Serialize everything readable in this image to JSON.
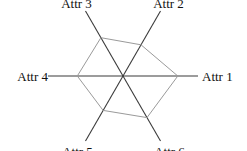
{
  "chart_data": {
    "type": "radar",
    "title": "",
    "categories": [
      "Attr 1",
      "Attr 2",
      "Attr 3",
      "Attr 4",
      "Attr 5",
      "Attr 6"
    ],
    "series": [
      {
        "name": "",
        "values": [
          0.73,
          0.48,
          0.59,
          0.61,
          0.53,
          0.64
        ]
      }
    ],
    "range": [
      0,
      1
    ],
    "grid": false,
    "legend": "none",
    "colors": {
      "axis": "#3a3a3a",
      "series": "#9a9a9a"
    }
  }
}
